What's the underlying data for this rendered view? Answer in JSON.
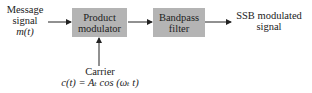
{
  "diagram": {
    "input": {
      "line1": "Message",
      "line2": "signal",
      "line3": "m(t)"
    },
    "blocks": [
      {
        "line1": "Product",
        "line2": "modulator"
      },
      {
        "line1": "Bandpass",
        "line2": "filter"
      }
    ],
    "output": {
      "line1": "SSB modulated",
      "line2": "signal"
    },
    "carrier": {
      "label": "Carrier",
      "equation": "c(t) = Aₜ cos (ωₜ t)"
    },
    "colors": {
      "block_fill": "#b4b4b4",
      "arrow": "#222222"
    }
  }
}
